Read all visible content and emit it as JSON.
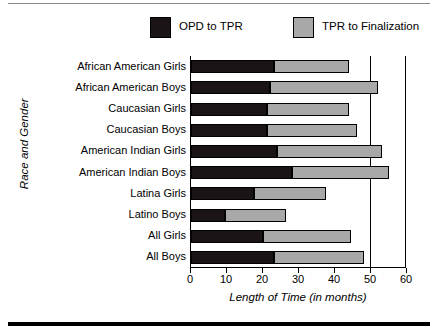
{
  "chart_data": {
    "type": "bar",
    "orientation": "horizontal",
    "stacked": true,
    "title": "",
    "xlabel": "Length of Time (in months)",
    "ylabel": "Race and Gender",
    "xlim": [
      0,
      60
    ],
    "xticks": [
      0,
      10,
      20,
      30,
      40,
      50,
      60
    ],
    "xtick_labels": [
      "0",
      "10",
      "20",
      "30",
      "40",
      "50",
      "60"
    ],
    "grid": "vertical gridline at 50 only",
    "legend_position": "top",
    "categories": [
      "African  American Girls",
      "African American Boys",
      "Caucasian Girls",
      "Caucasian Boys",
      "American Indian Girls",
      "American Indian Boys",
      "Latina Girls",
      "Latino Boys",
      "All Girls",
      "All Boys"
    ],
    "series": [
      {
        "name": "OPD to TPR",
        "color": "#1a1416",
        "values": [
          23,
          22,
          21,
          21,
          24,
          28,
          17.5,
          9.5,
          20,
          23
        ]
      },
      {
        "name": "TPR to Finalization",
        "color": "#a8a8a8",
        "values": [
          21,
          30,
          23,
          25,
          29,
          27,
          20,
          17,
          24.5,
          25
        ]
      }
    ],
    "totals": [
      44,
      52,
      44,
      46,
      53,
      55,
      37.5,
      26.5,
      44.5,
      48
    ]
  },
  "legend": {
    "items": [
      {
        "label": "OPD to TPR",
        "swatch": "dark-swatch"
      },
      {
        "label": "TPR to Finalization",
        "swatch": "gray-swatch"
      }
    ]
  },
  "axes": {
    "x_title": "Length of Time (in months)",
    "y_title": "Race and Gender"
  }
}
